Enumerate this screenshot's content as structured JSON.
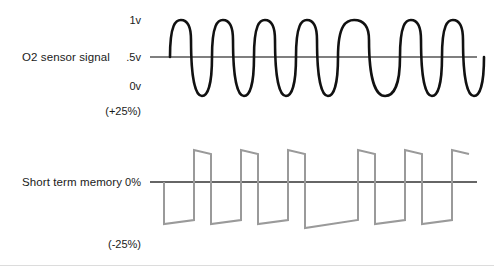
{
  "diagram": {
    "title_implied": "O2 sensor signal and short term memory waveform comparison",
    "background_color": "#ffffff"
  },
  "rows": [
    {
      "name": "o2-sensor-signal",
      "label": "O2 sensor signal",
      "trace_color": "#111111",
      "axis_ticks": [
        {
          "name": "tick-1v",
          "label": "1v"
        },
        {
          "name": "tick-05v",
          "label": ".5v"
        },
        {
          "name": "tick-0v",
          "label": "0v"
        },
        {
          "name": "tick-plus-25-percent",
          "label": "(+25%)"
        }
      ]
    },
    {
      "name": "short-term-memory",
      "label": "Short term memory",
      "trace_color": "#9a9a9a",
      "axis_ticks": [
        {
          "name": "tick-0-percent",
          "label": "0%"
        },
        {
          "name": "tick-minus-25-percent",
          "label": "(-25%)"
        }
      ]
    }
  ],
  "chart_data": [
    {
      "type": "line",
      "name": "o2-sensor-signal-trace",
      "title": "O2 sensor signal",
      "xlabel": "",
      "ylabel": "Voltage",
      "ylim": [
        0,
        1
      ],
      "ytick_labels": [
        "0v",
        ".5v",
        "1v"
      ],
      "ytick_values": [
        0,
        0.5,
        1
      ],
      "annotation": "(+25%)",
      "grid": false,
      "legend": "none",
      "baseline_value": 0.5,
      "waveform": "rounded square oscillation crossing the .5v baseline",
      "cycle_count": 7,
      "color": "#111111",
      "stroke_width": 2.6,
      "cycles": [
        {
          "index": 1,
          "start_x": 0,
          "width": 42,
          "note": "narrow"
        },
        {
          "index": 2,
          "start_x": 42,
          "width": 42,
          "note": "narrow"
        },
        {
          "index": 3,
          "start_x": 84,
          "width": 42,
          "note": "narrow"
        },
        {
          "index": 4,
          "start_x": 126,
          "width": 42,
          "note": "narrow"
        },
        {
          "index": 5,
          "start_x": 168,
          "width": 62,
          "note": "wide"
        },
        {
          "index": 6,
          "start_x": 230,
          "width": 42,
          "note": "narrow"
        },
        {
          "index": 7,
          "start_x": 272,
          "width": 42,
          "note": "narrow"
        }
      ]
    },
    {
      "type": "line",
      "name": "short-term-memory-trace",
      "title": "Short term memory",
      "xlabel": "",
      "ylabel": "Fuel trim",
      "ylim": [
        -25,
        25
      ],
      "ytick_labels": [
        "(-25%)",
        "0%"
      ],
      "ytick_values": [
        -25,
        0
      ],
      "annotation": "(-25%)",
      "grid": false,
      "legend": "none",
      "baseline_value": 0,
      "waveform": "sawtooth ramp integrator crossing the 0% baseline",
      "cycle_count": 6,
      "color": "#9a9a9a",
      "stroke_width": 2.0,
      "cycles": [
        {
          "index": 1,
          "start_x": 0,
          "width": 47,
          "note": "narrow ramp"
        },
        {
          "index": 2,
          "start_x": 47,
          "width": 47,
          "note": "narrow ramp"
        },
        {
          "index": 3,
          "start_x": 94,
          "width": 47,
          "note": "narrow ramp"
        },
        {
          "index": 4,
          "start_x": 141,
          "width": 70,
          "note": "wide ramp"
        },
        {
          "index": 5,
          "start_x": 211,
          "width": 47,
          "note": "narrow ramp"
        },
        {
          "index": 6,
          "start_x": 258,
          "width": 47,
          "note": "narrow ramp"
        }
      ]
    }
  ]
}
